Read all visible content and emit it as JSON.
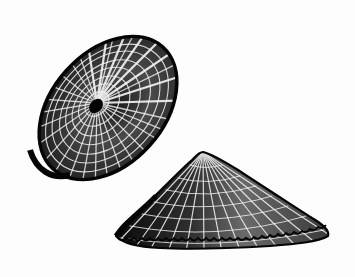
{
  "illustration": {
    "subject": "limpet shells",
    "style": "black-and-white engraving",
    "background_color": "#fdfdfd",
    "ink_color": "#0a0a0a",
    "highlight_color": "#ffffff",
    "figures": [
      {
        "view": "top",
        "label": "limpet-shell-top-view"
      },
      {
        "view": "side",
        "label": "limpet-shell-side-view"
      }
    ]
  }
}
